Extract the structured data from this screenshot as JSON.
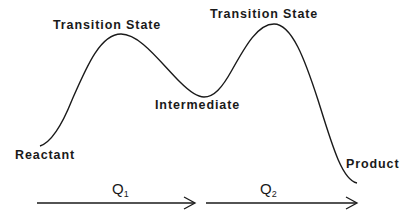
{
  "diagram": {
    "labels": {
      "ts1": "Transition State",
      "ts2": "Transition State",
      "intermediate": "Intermediate",
      "reactant": "Reactant",
      "product": "Product"
    },
    "coordinates": {
      "q1": {
        "base": "Q",
        "sub": "1"
      },
      "q2": {
        "base": "Q",
        "sub": "2"
      }
    },
    "colors": {
      "line": "#1a1a1a",
      "background": "#ffffff"
    }
  }
}
